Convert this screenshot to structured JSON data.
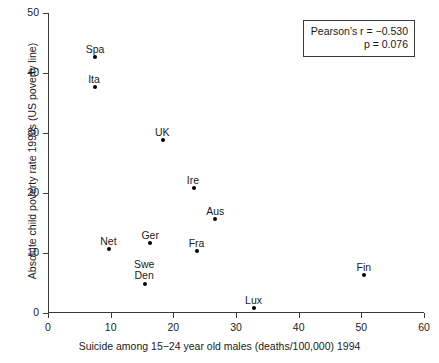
{
  "chart_data": {
    "type": "scatter",
    "title": "",
    "xlabel": "Suicide among 15−24 year old males (deaths/100,000) 1994",
    "ylabel": "Absolute child poverty rate 1990s (US poverty line)",
    "xlim": [
      0,
      60
    ],
    "ylim": [
      0,
      50
    ],
    "xticks": [
      "0",
      "10",
      "20",
      "30",
      "40",
      "50",
      "60"
    ],
    "yticks": [
      "0",
      "10",
      "20",
      "30",
      "40",
      "50"
    ],
    "grid": false,
    "legend": "none",
    "marker": "filled-circle",
    "marker_color": "#000000",
    "points": [
      {
        "label": "Spa",
        "x": 7.5,
        "y": 42.7,
        "label_dx": 0,
        "label_dy": -13
      },
      {
        "label": "Ita",
        "x": 7.5,
        "y": 37.7,
        "label_dx": -1,
        "label_dy": -13
      },
      {
        "label": "UK",
        "x": 18.4,
        "y": 28.8,
        "label_dx": -1,
        "label_dy": -13
      },
      {
        "label": "Ire",
        "x": 23.3,
        "y": 20.8,
        "label_dx": -1,
        "label_dy": -13
      },
      {
        "label": "Aus",
        "x": 26.7,
        "y": 15.7,
        "label_dx": 0,
        "label_dy": -13
      },
      {
        "label": "Net",
        "x": 9.8,
        "y": 10.7,
        "label_dx": -1,
        "label_dy": -13
      },
      {
        "label": "Ger",
        "x": 16.3,
        "y": 11.7,
        "label_dx": 0,
        "label_dy": -13
      },
      {
        "label": "Fra",
        "x": 23.7,
        "y": 10.4,
        "label_dx": 0,
        "label_dy": -13
      },
      {
        "label": "Swe",
        "x": 15.5,
        "y": 4.9,
        "label_dx": -1,
        "label_dy": -25
      },
      {
        "label": "Den",
        "x": 15.5,
        "y": 4.9,
        "label_dx": -1,
        "label_dy": -14
      },
      {
        "label": "Lux",
        "x": 32.8,
        "y": 0.8,
        "label_dx": 0,
        "label_dy": -13
      },
      {
        "label": "Fin",
        "x": 50.4,
        "y": 6.3,
        "label_dx": 0,
        "label_dy": -13
      }
    ],
    "annotations": {
      "stats_line_1": "Pearson's r = −0.530",
      "stats_line_2": "p = 0.076"
    }
  }
}
